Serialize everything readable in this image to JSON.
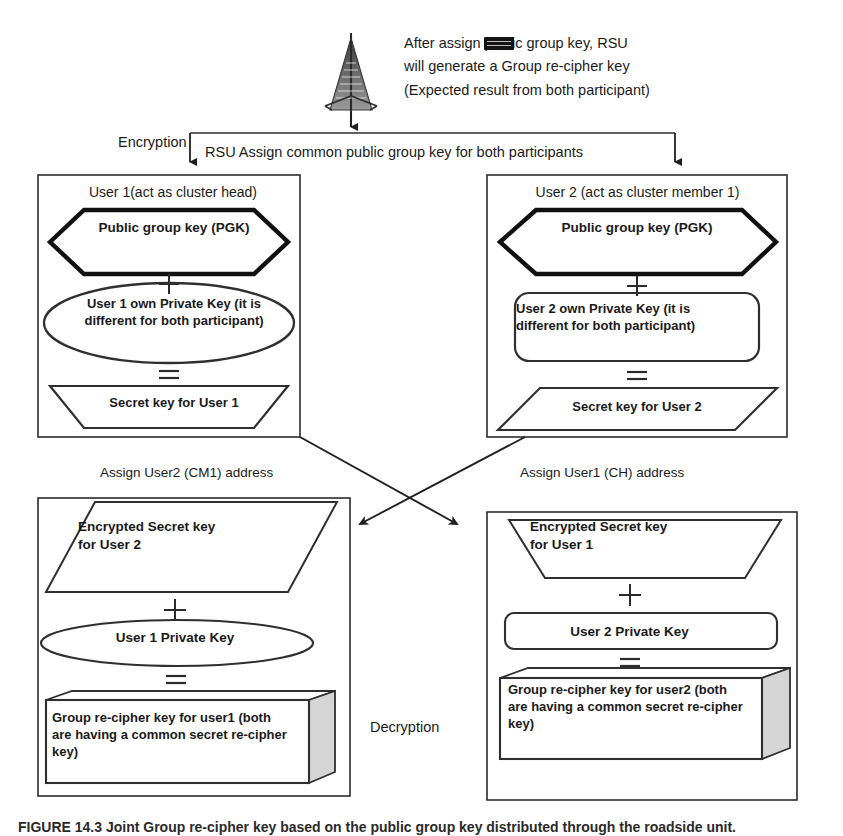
{
  "figure": {
    "top_note": "After assign          public group key, RSU\nwill generate a Group re-cipher key\n(Expected result from both participant)",
    "key_chip_icon": "black-key-chip-icon",
    "tower_icon": "radio-tower-icon",
    "encryption_label": "Encryption",
    "decryption_label": "Decryption",
    "rsu_bus_label": "RSU Assign common public group key for both participants",
    "assign_left_label": "Assign User2 (CM1) address",
    "assign_right_label": "Assign User1 (CH) address",
    "caption": "FIGURE 14.3 Joint Group re-cipher key based on the public group key distributed through the roadside unit."
  },
  "boxes": {
    "user1": {
      "title": "User 1(act as cluster head)",
      "pgk": "Public group key (PGK)",
      "operator_plus": "+",
      "private_key": "User 1 own Private Key (it is\ndifferent for both participant)",
      "operator_equals": "=",
      "secret_key": "Secret key for User 1"
    },
    "user2": {
      "title": "User 2 (act as cluster member 1)",
      "pgk": "Public group key (PGK)",
      "operator_plus": "+",
      "private_key": "User 2 own Private Key (it is\ndifferent for both participant)",
      "operator_equals": "=",
      "secret_key": "Secret key for User 2"
    },
    "decrypt_left": {
      "encrypted_secret": "Encrypted Secret key\nfor User 2",
      "operator_plus": "+",
      "private_key": "User 1 Private Key",
      "operator_equals": "=",
      "result": "Group re-cipher key for user1 (both\nare having a common secret re-cipher\nkey)"
    },
    "decrypt_right": {
      "encrypted_secret": "Encrypted Secret key\nfor User 1",
      "operator_plus": "+",
      "private_key": "User 2 Private Key",
      "operator_equals": "=",
      "result": "Group re-cipher key for user2 (both\nare having a common secret re-cipher\nkey)"
    }
  },
  "colors": {
    "ink": "#1a1a1a",
    "line": "#2b2b2b",
    "thick": "#111111",
    "cube_shade": "#d5d5d5",
    "page": "#ffffff"
  }
}
